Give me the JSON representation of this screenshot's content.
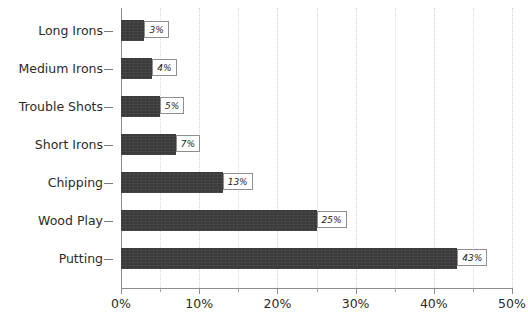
{
  "chart_data": {
    "type": "bar",
    "orientation": "horizontal",
    "title": "",
    "subtitle": "",
    "xlabel": "",
    "ylabel": "",
    "categories": [
      "Long Irons",
      "Medium Irons",
      "Trouble Shots",
      "Short Irons",
      "Chipping",
      "Wood Play",
      "Putting"
    ],
    "values": [
      3,
      4,
      5,
      7,
      13,
      25,
      43
    ],
    "value_labels": [
      "3%",
      "4%",
      "5%",
      "7%",
      "13%",
      "25%",
      "43%"
    ],
    "xlim": [
      0,
      50
    ],
    "x_major_ticks": [
      0,
      10,
      20,
      30,
      40,
      50
    ],
    "x_tick_labels": [
      "0%",
      "10%",
      "20%",
      "30%",
      "40%",
      "50%"
    ],
    "x_minor_ticks": [
      5,
      15,
      25,
      35,
      45
    ],
    "grid": {
      "vertical": true,
      "horizontal": false,
      "style": "dotted",
      "interval": 5
    },
    "legend": {
      "visible": false,
      "position": "none",
      "entries": []
    },
    "annotations": [],
    "colors": {
      "bar_fill": "#3a3a3a",
      "background": "#ffffff",
      "axis": "#8c8c8c",
      "gridline": "#d9d9d9",
      "label_box_border": "#8f8f8f",
      "label_box_fill": "#ffffff",
      "text": "#2b2b2b"
    }
  }
}
